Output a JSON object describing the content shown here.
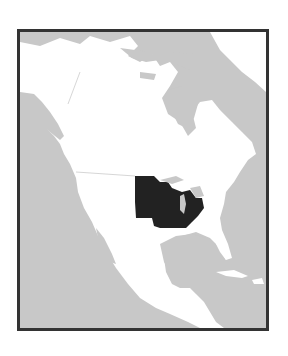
{
  "map": {
    "subject": "North America locator map",
    "highlighted_region": "US Midwest (Great Lakes states)",
    "colors": {
      "ocean": "#c8c8c8",
      "land": "#ffffff",
      "highlight": "#222222",
      "border": "#333333",
      "lakes": "#c8c8c8"
    },
    "regions_shown": [
      "Canada",
      "Alaska",
      "Greenland",
      "United States",
      "Mexico",
      "Central America",
      "Caribbean"
    ]
  }
}
